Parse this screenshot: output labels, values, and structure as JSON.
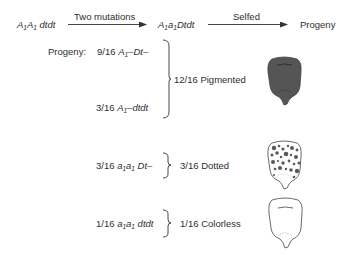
{
  "cross": {
    "parent_genotype": {
      "gene1": "A",
      "sub1": "1",
      "gene2": "A",
      "sub2": "1",
      "rest": " dtdt"
    },
    "step1_label": "Two mutations",
    "mutant_genotype": {
      "gene1": "A",
      "sub1": "1",
      "gene2": "a",
      "sub2": "1",
      "rest": "Dtdt"
    },
    "step2_label": "Selfed",
    "result_label": "Progeny"
  },
  "progeny_label": "Progeny:",
  "classes": [
    {
      "fraction": "9/16",
      "genotype_pre": "A",
      "sub": "1",
      "genotype_post": "–Dt–"
    },
    {
      "fraction": "3/16",
      "genotype_pre": "A",
      "sub": "1",
      "genotype_post": "–dtdt"
    },
    {
      "fraction": "3/16",
      "g1": "a",
      "s1": "1",
      "g2": "a",
      "s2": "1",
      "genotype_post": " Dt–"
    },
    {
      "fraction": "1/16",
      "g1": "a",
      "s1": "1",
      "g2": "a",
      "s2": "1",
      "genotype_post": " dtdt"
    }
  ],
  "phenotypes": [
    {
      "label": "12/16 Pigmented",
      "kernel": "pigmented-kernel",
      "color": "#555555"
    },
    {
      "label": "3/16 Dotted",
      "kernel": "dotted-kernel",
      "color": "#5a5a5a"
    },
    {
      "label": "1/16 Colorless",
      "kernel": "colorless-kernel",
      "color": "#ffffff"
    }
  ]
}
